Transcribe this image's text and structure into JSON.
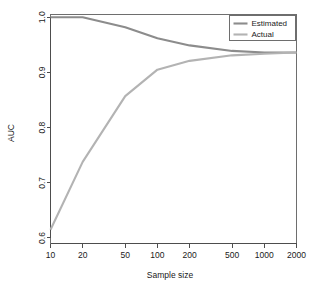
{
  "chart_data": {
    "type": "line",
    "title": "",
    "xlabel": "Sample size",
    "ylabel": "AUC",
    "x_scale": "log",
    "x": [
      10,
      20,
      50,
      100,
      200,
      500,
      1000,
      2000
    ],
    "xticklabels": [
      "10",
      "20",
      "50",
      "100",
      "200",
      "500",
      "1000",
      "2000"
    ],
    "xlim": [
      10,
      2000
    ],
    "yticks": [
      0.6,
      0.7,
      0.8,
      0.9,
      1.0
    ],
    "yticklabels": [
      "0.6",
      "0.7",
      "0.8",
      "0.9",
      "1.0"
    ],
    "ylim": [
      0.59,
      1.005
    ],
    "grid": false,
    "legend_position": "top-right",
    "series": [
      {
        "name": "Estimated",
        "color": "#8c8c8c",
        "values": [
          1.0,
          1.0,
          0.982,
          0.962,
          0.949,
          0.939,
          0.936,
          0.936
        ]
      },
      {
        "name": "Actual",
        "color": "#b3b3b3",
        "values": [
          0.615,
          0.738,
          0.857,
          0.905,
          0.921,
          0.931,
          0.934,
          0.936
        ]
      }
    ]
  },
  "legend": {
    "items": [
      {
        "label": "Estimated"
      },
      {
        "label": "Actual"
      }
    ]
  },
  "colors": {
    "estimated": "#8c8c8c",
    "actual": "#b3b3b3",
    "axis": "#4d4d4d",
    "frame": "#6e6e6e",
    "text": "#1a1a1a",
    "background": "#ffffff"
  }
}
